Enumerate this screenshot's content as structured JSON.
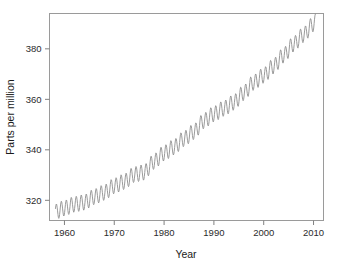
{
  "chart_data": {
    "type": "line",
    "title": "",
    "xlabel": "Year",
    "ylabel": "Parts per million",
    "xlim": [
      1957.0,
      2012.0
    ],
    "ylim": [
      312.0,
      394.0
    ],
    "xticks": [
      1960,
      1970,
      1980,
      1990,
      2000,
      2010
    ],
    "xtick_labels": [
      "1960",
      "1970",
      "1980",
      "1990",
      "2000",
      "2010"
    ],
    "yticks": [
      320,
      340,
      360,
      380
    ],
    "ytick_labels": [
      "320",
      "340",
      "360",
      "380"
    ],
    "grid": false,
    "legend": "none",
    "series_color": "#8f8f8f",
    "axis_color": "#808080",
    "seasonal_amplitude_ppm": 3.1,
    "seasonal_peak_month": 5,
    "x_start": 1958.2,
    "x_end": 2010.4,
    "sampling_per_year": 12,
    "trend_x": [
      1958,
      1960,
      1962,
      1964,
      1966,
      1968,
      1970,
      1972,
      1974,
      1976,
      1978,
      1980,
      1982,
      1984,
      1986,
      1988,
      1990,
      1992,
      1994,
      1996,
      1998,
      2000,
      2002,
      2004,
      2006,
      2008,
      2010
    ],
    "trend_y": [
      315.3,
      316.9,
      318.4,
      319.2,
      321.4,
      323.1,
      325.7,
      327.4,
      330.2,
      331.1,
      335.4,
      338.7,
      341.1,
      344.4,
      347.2,
      351.5,
      354.2,
      356.4,
      358.8,
      362.6,
      366.7,
      369.5,
      373.2,
      377.5,
      381.9,
      385.6,
      389.9
    ]
  }
}
